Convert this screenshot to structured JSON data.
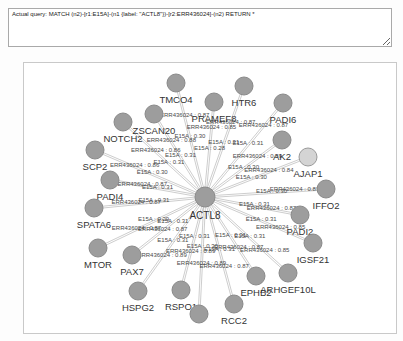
{
  "query": {
    "text": "Actual query: MATCH (n2)-[r1:E15A]-(n1 {label: \"ACTL8\"})-[r2:ERR436024]-(n2) RETURN *"
  },
  "graph": {
    "type": "network",
    "edge_types": [
      "E15A",
      "ERR436024"
    ],
    "colors": {
      "node_fill": "#9d9d9d",
      "node_stroke": "#8a8a8a",
      "highlight_fill": "#d4d4d4",
      "highlight_stroke": "#9a9a9a",
      "edge": "#b8b8b8",
      "edge_label": "#4a4a4a",
      "node_label": "#333333"
    },
    "center": {
      "id": "ACTL8",
      "label": "ACTL8",
      "x": 181,
      "y": 134
    },
    "nodes": [
      {
        "label": "TMCO4",
        "x": 152,
        "y": 20,
        "e15a": "E15A : 0.30",
        "err": "ERR436024 : 0.87",
        "t1": 0.52,
        "t2": 0.7,
        "highlighted": false
      },
      {
        "label": "HTR6",
        "x": 220,
        "y": 23,
        "e15a": "E15A : 0.31",
        "err": "ERR436024 : 0.87",
        "t1": 0.48,
        "t2": 0.66,
        "highlighted": false
      },
      {
        "label": "PRAMEF8",
        "x": 190,
        "y": 39,
        "e15a": "E15A : 0.28",
        "err": "ERR436024 : 0.85",
        "t1": 0.5,
        "t2": 0.72,
        "highlighted": false
      },
      {
        "label": "PADI6",
        "x": 259,
        "y": 40,
        "e15a": "E15A : 0.31",
        "err": "ERR436024 : 0.87",
        "t1": 0.55,
        "t2": 0.75,
        "highlighted": false
      },
      {
        "label": "ZSCAN20",
        "x": 130,
        "y": 51,
        "e15a": "E15A : 0.31",
        "err": "ERR436024 : 0.88",
        "t1": 0.48,
        "t2": 0.66,
        "highlighted": false
      },
      {
        "label": "NOTCH2",
        "x": 99,
        "y": 59,
        "e15a": "E15A : 0.31",
        "err": "ERR436024 : 0.86",
        "t1": 0.44,
        "t2": 0.6,
        "highlighted": false
      },
      {
        "label": "AK2",
        "x": 258,
        "y": 77,
        "e15a": "E15A : 0.30",
        "err": "ERR436024 : 0.89",
        "t1": 0.5,
        "t2": 0.68,
        "highlighted": false
      },
      {
        "label": "AJAP1",
        "x": 284,
        "y": 94,
        "e15a": "E15A : 0.30",
        "err": "ERR436024 : 0.84",
        "t1": 0.45,
        "t2": 0.62,
        "highlighted": true
      },
      {
        "label": "SCP2",
        "x": 71,
        "y": 87,
        "e15a": "E15A : 0.30",
        "err": "ERR436024 : 0.86",
        "t1": 0.48,
        "t2": 0.64,
        "highlighted": false
      },
      {
        "label": "IFFO2",
        "x": 302,
        "y": 126,
        "e15a": "E15A : 0.30",
        "err": "ERR436024 : 0.87",
        "t1": 0.55,
        "t2": 0.74,
        "highlighted": false
      },
      {
        "label": "PADI4",
        "x": 86,
        "y": 117,
        "e15a": "E15A : 0.31",
        "err": "ERR436024 : 0.87",
        "t1": 0.5,
        "t2": 0.66,
        "highlighted": false
      },
      {
        "label": "PADI2",
        "x": 276,
        "y": 152,
        "e15a": "E15A : 0.31",
        "err": "ERR436024 : 0.87",
        "t1": 0.52,
        "t2": 0.7,
        "highlighted": false
      },
      {
        "label": "SPATA6",
        "x": 70,
        "y": 145,
        "e15a": "E15A : 0.31",
        "err": "ERR436024 : 0.87",
        "t1": 0.46,
        "t2": 0.62,
        "highlighted": false
      },
      {
        "label": "IGSF21",
        "x": 289,
        "y": 180,
        "e15a": "E15A : 0.31",
        "err": "ERR436024 : 0.85",
        "t1": 0.52,
        "t2": 0.7,
        "highlighted": false
      },
      {
        "label": "MTOR",
        "x": 74,
        "y": 185,
        "e15a": "E15A : 0.29",
        "err": "ERR436024 : 0.87",
        "t1": 0.48,
        "t2": 0.64,
        "highlighted": false
      },
      {
        "label": "PAX7",
        "x": 108,
        "y": 192,
        "e15a": "E15A : 0.31",
        "err": "ERR436024 : 0.87",
        "t1": 0.44,
        "t2": 0.58,
        "highlighted": false
      },
      {
        "label": "EPHB2",
        "x": 232,
        "y": 213,
        "e15a": "E15A : 0.31",
        "err": "ERR436024 : 0.87",
        "t1": 0.5,
        "t2": 0.66,
        "highlighted": false
      },
      {
        "label": "ARHGEF10L",
        "x": 264,
        "y": 210,
        "e15a": "E15A : 0.31",
        "err": "ERR436024 : 0.85",
        "t1": 0.54,
        "t2": 0.72,
        "highlighted": false
      },
      {
        "label": "HSPG2",
        "x": 114,
        "y": 228,
        "e15a": "E15A : 0.31",
        "err": "ERR436024 : 0.89",
        "t1": 0.48,
        "t2": 0.64,
        "highlighted": false
      },
      {
        "label": "RSPO1",
        "x": 157,
        "y": 227,
        "e15a": "E15A : 0.31",
        "err": "ERR436024 : 0.89",
        "t1": 0.44,
        "t2": 0.6,
        "highlighted": false
      },
      {
        "label": "RCC2",
        "x": 210,
        "y": 241,
        "e15a": "E15A : 0.31",
        "err": "ERR436024 : 0.87",
        "t1": 0.5,
        "t2": 0.66,
        "highlighted": false
      },
      {
        "label": "",
        "x": 175,
        "y": 251,
        "e15a": "E15A : 0.30",
        "err": "ERR436024 : 0.89",
        "t1": 0.44,
        "t2": 0.58,
        "highlighted": false
      }
    ]
  }
}
